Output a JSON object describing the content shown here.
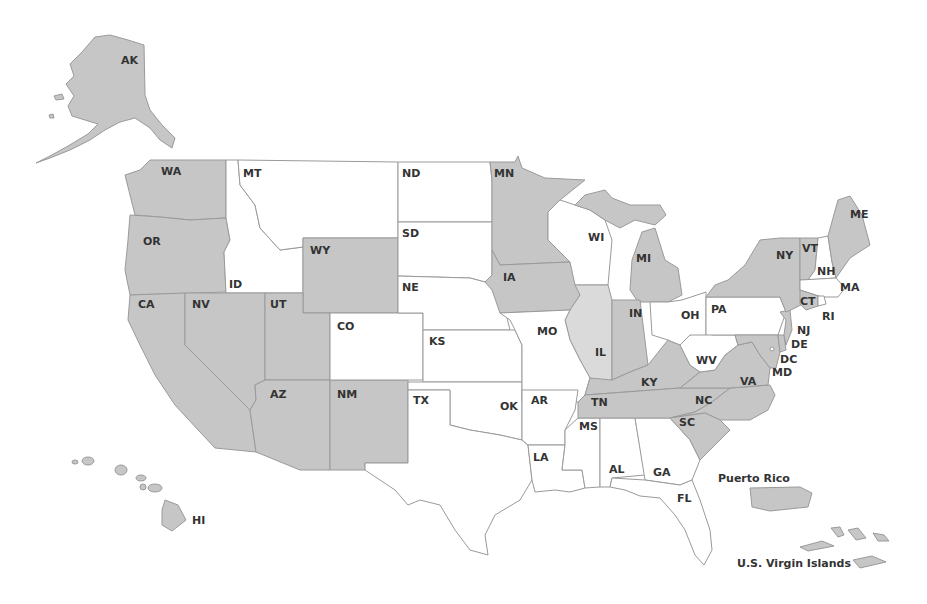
{
  "colors": {
    "shaded": "#c6c6c6",
    "light": "#dadada",
    "unshaded": "#ffffff",
    "border": "#9a9a9a",
    "label": "#333333"
  },
  "states": [
    {
      "code": "AK",
      "fill": "shaded",
      "label_x": 121,
      "label_y": 55
    },
    {
      "code": "HI",
      "fill": "shaded",
      "label_x": 192,
      "label_y": 515
    },
    {
      "code": "WA",
      "fill": "shaded",
      "label_x": 161,
      "label_y": 166
    },
    {
      "code": "OR",
      "fill": "shaded",
      "label_x": 143,
      "label_y": 236
    },
    {
      "code": "CA",
      "fill": "shaded",
      "label_x": 138,
      "label_y": 299
    },
    {
      "code": "NV",
      "fill": "shaded",
      "label_x": 192,
      "label_y": 299
    },
    {
      "code": "UT",
      "fill": "shaded",
      "label_x": 270,
      "label_y": 299
    },
    {
      "code": "AZ",
      "fill": "shaded",
      "label_x": 270,
      "label_y": 389
    },
    {
      "code": "NM",
      "fill": "shaded",
      "label_x": 337,
      "label_y": 389
    },
    {
      "code": "WY",
      "fill": "shaded",
      "label_x": 310,
      "label_y": 245
    },
    {
      "code": "MT",
      "fill": "unshaded",
      "label_x": 243,
      "label_y": 168
    },
    {
      "code": "ID",
      "fill": "unshaded",
      "label_x": 229,
      "label_y": 279
    },
    {
      "code": "CO",
      "fill": "unshaded",
      "label_x": 337,
      "label_y": 321
    },
    {
      "code": "ND",
      "fill": "unshaded",
      "label_x": 402,
      "label_y": 168
    },
    {
      "code": "SD",
      "fill": "unshaded",
      "label_x": 402,
      "label_y": 228
    },
    {
      "code": "NE",
      "fill": "unshaded",
      "label_x": 402,
      "label_y": 282
    },
    {
      "code": "KS",
      "fill": "unshaded",
      "label_x": 429,
      "label_y": 336
    },
    {
      "code": "TX",
      "fill": "unshaded",
      "label_x": 413,
      "label_y": 395
    },
    {
      "code": "OK",
      "fill": "unshaded",
      "label_x": 500,
      "label_y": 401
    },
    {
      "code": "MN",
      "fill": "shaded",
      "label_x": 494,
      "label_y": 168
    },
    {
      "code": "IA",
      "fill": "shaded",
      "label_x": 503,
      "label_y": 272
    },
    {
      "code": "MO",
      "fill": "unshaded",
      "label_x": 537,
      "label_y": 326
    },
    {
      "code": "AR",
      "fill": "unshaded",
      "label_x": 531,
      "label_y": 395
    },
    {
      "code": "LA",
      "fill": "unshaded",
      "label_x": 533,
      "label_y": 452
    },
    {
      "code": "WI",
      "fill": "unshaded",
      "label_x": 588,
      "label_y": 232
    },
    {
      "code": "IL",
      "fill": "light",
      "label_x": 595,
      "label_y": 347
    },
    {
      "code": "MI",
      "fill": "shaded",
      "label_x": 636,
      "label_y": 253
    },
    {
      "code": "IN",
      "fill": "shaded",
      "label_x": 629,
      "label_y": 308
    },
    {
      "code": "OH",
      "fill": "unshaded",
      "label_x": 681,
      "label_y": 310
    },
    {
      "code": "KY",
      "fill": "shaded",
      "label_x": 641,
      "label_y": 377
    },
    {
      "code": "TN",
      "fill": "shaded",
      "label_x": 591,
      "label_y": 397
    },
    {
      "code": "MS",
      "fill": "unshaded",
      "label_x": 579,
      "label_y": 421
    },
    {
      "code": "AL",
      "fill": "unshaded",
      "label_x": 609,
      "label_y": 464
    },
    {
      "code": "GA",
      "fill": "unshaded",
      "label_x": 653,
      "label_y": 467
    },
    {
      "code": "FL",
      "fill": "unshaded",
      "label_x": 677,
      "label_y": 493
    },
    {
      "code": "SC",
      "fill": "shaded",
      "label_x": 679,
      "label_y": 417
    },
    {
      "code": "NC",
      "fill": "shaded",
      "label_x": 695,
      "label_y": 395
    },
    {
      "code": "VA",
      "fill": "shaded",
      "label_x": 740,
      "label_y": 376
    },
    {
      "code": "WV",
      "fill": "unshaded",
      "label_x": 696,
      "label_y": 355
    },
    {
      "code": "PA",
      "fill": "unshaded",
      "label_x": 711,
      "label_y": 304
    },
    {
      "code": "MD",
      "fill": "shaded",
      "label_x": 772,
      "label_y": 367
    },
    {
      "code": "DC",
      "fill": "unshaded",
      "label_x": 780,
      "label_y": 354
    },
    {
      "code": "DE",
      "fill": "shaded",
      "label_x": 791,
      "label_y": 339
    },
    {
      "code": "NJ",
      "fill": "shaded",
      "label_x": 797,
      "label_y": 325
    },
    {
      "code": "NY",
      "fill": "shaded",
      "label_x": 776,
      "label_y": 250
    },
    {
      "code": "CT",
      "fill": "shaded",
      "label_x": 800,
      "label_y": 296
    },
    {
      "code": "RI",
      "fill": "unshaded",
      "label_x": 822,
      "label_y": 311
    },
    {
      "code": "MA",
      "fill": "unshaded",
      "label_x": 840,
      "label_y": 282
    },
    {
      "code": "NH",
      "fill": "unshaded",
      "label_x": 817,
      "label_y": 266
    },
    {
      "code": "VT",
      "fill": "shaded",
      "label_x": 802,
      "label_y": 243
    },
    {
      "code": "ME",
      "fill": "shaded",
      "label_x": 850,
      "label_y": 209
    }
  ],
  "territories": [
    {
      "name": "Puerto Rico",
      "fill": "shaded",
      "label_x": 718,
      "label_y": 473
    },
    {
      "name": "U.S. Virgin Islands",
      "fill": "shaded",
      "label_x": 737,
      "label_y": 558
    }
  ]
}
